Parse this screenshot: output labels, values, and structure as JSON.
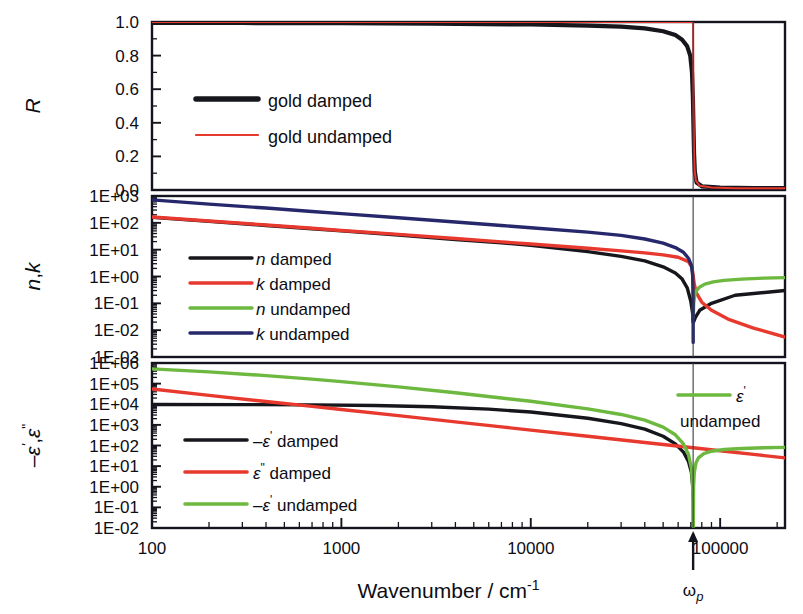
{
  "figure": {
    "xlabel": "Wavenumber / cm",
    "xlabel_exponent": "-1",
    "plasma_marker": "ω",
    "plasma_marker_sub": "p",
    "plasma_value": 72000
  },
  "colors": {
    "black": "#16161d",
    "red": "#e8392f",
    "green": "#6db83f",
    "navy": "#27286b",
    "frame": "#14141e",
    "vline": "#3a3a44"
  },
  "xaxis": {
    "min": 100,
    "max": 220000,
    "scale": "log",
    "ticks": [
      {
        "value": 100,
        "label": "100"
      },
      {
        "value": 1000,
        "label": "1000"
      },
      {
        "value": 10000,
        "label": "10000"
      },
      {
        "value": 100000,
        "label": "100000"
      }
    ]
  },
  "chart_data": [
    {
      "type": "line",
      "panel": "top",
      "ylabel": "R",
      "xlabel": "Wavenumber / cm-1",
      "yscale": "linear",
      "ylim": [
        0.0,
        1.0
      ],
      "yticks": [
        "0.0",
        "0.2",
        "0.4",
        "0.6",
        "0.8",
        "1.0"
      ],
      "grid": false,
      "legend_position": "center-left",
      "series": [
        {
          "name": "gold damped",
          "color": "#16161d",
          "width": 4.2,
          "points": [
            [
              100,
              0.995
            ],
            [
              300,
              0.994
            ],
            [
              1000,
              0.993
            ],
            [
              3000,
              0.99
            ],
            [
              10000,
              0.985
            ],
            [
              20000,
              0.979
            ],
            [
              30000,
              0.972
            ],
            [
              40000,
              0.962
            ],
            [
              50000,
              0.945
            ],
            [
              58000,
              0.922
            ],
            [
              63000,
              0.895
            ],
            [
              67000,
              0.855
            ],
            [
              69500,
              0.8
            ],
            [
              71000,
              0.7
            ],
            [
              71800,
              0.55
            ],
            [
              72300,
              0.38
            ],
            [
              72800,
              0.22
            ],
            [
              73500,
              0.11
            ],
            [
              75000,
              0.045
            ],
            [
              80000,
              0.022
            ],
            [
              100000,
              0.014
            ],
            [
              150000,
              0.012
            ],
            [
              220000,
              0.012
            ]
          ]
        },
        {
          "name": "gold undamped",
          "color": "#e8392f",
          "width": 2.0,
          "points": [
            [
              100,
              1.0
            ],
            [
              1000,
              1.0
            ],
            [
              10000,
              1.0
            ],
            [
              40000,
              1.0
            ],
            [
              60000,
              1.0
            ],
            [
              69000,
              1.0
            ],
            [
              71000,
              1.0
            ],
            [
              71900,
              1.0
            ],
            [
              72000,
              0.99
            ],
            [
              72100,
              0.8
            ],
            [
              72300,
              0.5
            ],
            [
              72700,
              0.25
            ],
            [
              73300,
              0.12
            ],
            [
              74500,
              0.055
            ],
            [
              78000,
              0.025
            ],
            [
              90000,
              0.015
            ],
            [
              120000,
              0.011
            ],
            [
              220000,
              0.01
            ]
          ]
        }
      ]
    },
    {
      "type": "line",
      "panel": "middle",
      "ylabel": "n,k",
      "yscale": "log",
      "ylim": [
        0.001,
        1000
      ],
      "yticks": [
        "1E-03",
        "1E-02",
        "1E-01",
        "1E+00",
        "1E+01",
        "1E+02",
        "1E+03"
      ],
      "grid": false,
      "legend_position": "left",
      "series": [
        {
          "name": "n damped",
          "color": "#16161d",
          "width": 3.4,
          "points": [
            [
              100,
              160
            ],
            [
              200,
              113
            ],
            [
              400,
              80
            ],
            [
              700,
              60
            ],
            [
              1000,
              50
            ],
            [
              2000,
              35
            ],
            [
              4000,
              24
            ],
            [
              7000,
              18
            ],
            [
              10000,
              14.5
            ],
            [
              20000,
              8.5
            ],
            [
              30000,
              5.6
            ],
            [
              40000,
              3.8
            ],
            [
              50000,
              2.3
            ],
            [
              58000,
              1.35
            ],
            [
              63000,
              0.8
            ],
            [
              67000,
              0.38
            ],
            [
              70000,
              0.12
            ],
            [
              71500,
              0.045
            ],
            [
              72000,
              0.02
            ],
            [
              72600,
              0.021
            ],
            [
              74000,
              0.03
            ],
            [
              78000,
              0.055
            ],
            [
              90000,
              0.1
            ],
            [
              120000,
              0.2
            ],
            [
              220000,
              0.3
            ]
          ]
        },
        {
          "name": "k damped",
          "color": "#e8392f",
          "width": 3.4,
          "points": [
            [
              100,
              165
            ],
            [
              200,
              117
            ],
            [
              400,
              83
            ],
            [
              700,
              63
            ],
            [
              1000,
              52
            ],
            [
              2000,
              37
            ],
            [
              4000,
              26
            ],
            [
              7000,
              19.5
            ],
            [
              10000,
              16.2
            ],
            [
              20000,
              11.3
            ],
            [
              30000,
              9.0
            ],
            [
              40000,
              7.6
            ],
            [
              50000,
              6.4
            ],
            [
              60000,
              5.2
            ],
            [
              68000,
              3.6
            ],
            [
              71000,
              2.2
            ],
            [
              72000,
              1.1
            ],
            [
              73000,
              0.52
            ],
            [
              75000,
              0.24
            ],
            [
              80000,
              0.11
            ],
            [
              90000,
              0.055
            ],
            [
              110000,
              0.026
            ],
            [
              150000,
              0.012
            ],
            [
              220000,
              0.0055
            ]
          ]
        },
        {
          "name": "n undamped",
          "color": "#6db83f",
          "width": 3.4,
          "points": [
            [
              72100,
              0.03
            ],
            [
              72500,
              0.1
            ],
            [
              73500,
              0.21
            ],
            [
              75000,
              0.3
            ],
            [
              78000,
              0.41
            ],
            [
              83000,
              0.52
            ],
            [
              92000,
              0.63
            ],
            [
              105000,
              0.72
            ],
            [
              130000,
              0.8
            ],
            [
              170000,
              0.87
            ],
            [
              220000,
              0.91
            ]
          ]
        },
        {
          "name": "k undamped",
          "color": "#27286b",
          "width": 3.4,
          "points": [
            [
              100,
              720
            ],
            [
              200,
              500
            ],
            [
              400,
              355
            ],
            [
              700,
              265
            ],
            [
              1000,
              220
            ],
            [
              2000,
              155
            ],
            [
              4000,
              108
            ],
            [
              7000,
              80
            ],
            [
              10000,
              66
            ],
            [
              20000,
              45
            ],
            [
              30000,
              34
            ],
            [
              40000,
              25
            ],
            [
              50000,
              17.5
            ],
            [
              58000,
              12.0
            ],
            [
              64000,
              8.0
            ],
            [
              68000,
              4.8
            ],
            [
              70500,
              2.6
            ],
            [
              71600,
              1.1
            ],
            [
              72000,
              0.1
            ],
            [
              72050,
              0.0035
            ]
          ]
        }
      ]
    },
    {
      "type": "line",
      "panel": "bottom",
      "ylabel": "-ε',ε\"",
      "yscale": "log",
      "ylim": [
        0.01,
        1000000
      ],
      "yticks": [
        "1E-02",
        "1E-01",
        "1E+00",
        "1E+01",
        "1E+02",
        "1E+03",
        "1E+04",
        "1E+05",
        "1E+06"
      ],
      "grid": false,
      "legend_position": "left",
      "series": [
        {
          "name": "-ε' damped",
          "color": "#16161d",
          "width": 3.4,
          "points": [
            [
              100,
              9800
            ],
            [
              300,
              9600
            ],
            [
              700,
              9300
            ],
            [
              1500,
              8700
            ],
            [
              3000,
              7600
            ],
            [
              6000,
              5800
            ],
            [
              10000,
              4200
            ],
            [
              20000,
              2100
            ],
            [
              30000,
              1150
            ],
            [
              40000,
              620
            ],
            [
              50000,
              280
            ],
            [
              58000,
              120
            ],
            [
              64000,
              48
            ],
            [
              68000,
              17
            ],
            [
              70500,
              5.0
            ],
            [
              71600,
              1.2
            ],
            [
              72000,
              0.3
            ]
          ]
        },
        {
          "name": "ε\" damped",
          "color": "#e8392f",
          "width": 3.4,
          "points": [
            [
              100,
              55000
            ],
            [
              200,
              27000
            ],
            [
              400,
              13500
            ],
            [
              700,
              7900
            ],
            [
              1000,
              5600
            ],
            [
              2000,
              2800
            ],
            [
              4000,
              1400
            ],
            [
              7000,
              800
            ],
            [
              10000,
              560
            ],
            [
              20000,
              280
            ],
            [
              40000,
              140
            ],
            [
              70000,
              80
            ],
            [
              100000,
              56
            ],
            [
              150000,
              37
            ],
            [
              220000,
              25
            ]
          ]
        },
        {
          "name": "-ε' undamped",
          "color": "#6db83f",
          "width": 3.4,
          "points": [
            [
              100,
              520000
            ],
            [
              200,
              370000
            ],
            [
              400,
              245000
            ],
            [
              700,
              165000
            ],
            [
              1000,
              125000
            ],
            [
              2000,
              70000
            ],
            [
              4000,
              36000
            ],
            [
              7000,
              20000
            ],
            [
              10000,
              14000
            ],
            [
              20000,
              6000
            ],
            [
              30000,
              3200
            ],
            [
              40000,
              1700
            ],
            [
              50000,
              780
            ],
            [
              58000,
              330
            ],
            [
              64000,
              120
            ],
            [
              68000,
              38
            ],
            [
              70500,
              8.0
            ],
            [
              71600,
              1.0
            ],
            [
              72000,
              0.012
            ]
          ]
        },
        {
          "name": "ε' undamped",
          "color": "#6db83f",
          "width": 3.4,
          "points": [
            [
              72050,
              0.012
            ],
            [
              72400,
              1.0
            ],
            [
              73000,
              5.0
            ],
            [
              74500,
              14
            ],
            [
              77000,
              26
            ],
            [
              82000,
              40
            ],
            [
              90000,
              53
            ],
            [
              105000,
              64
            ],
            [
              130000,
              72
            ],
            [
              170000,
              78
            ],
            [
              220000,
              81
            ]
          ]
        }
      ]
    }
  ],
  "legends": {
    "top": [
      {
        "label": "gold damped",
        "color": "#16161d",
        "width": 5.5
      },
      {
        "label": "gold undamped",
        "color": "#e8392f",
        "width": 2.2
      }
    ],
    "middle": [
      {
        "symbol": "n",
        "rest": " damped",
        "color": "#16161d"
      },
      {
        "symbol": "k",
        "rest": " damped",
        "color": "#e8392f"
      },
      {
        "symbol": "n",
        "rest": " undamped",
        "color": "#6db83f"
      },
      {
        "symbol": "k",
        "rest": " undamped",
        "color": "#27286b"
      }
    ],
    "bottom": [
      {
        "prefix": "–",
        "symbol": "ε",
        "sup": "'",
        "rest": " damped",
        "color": "#16161d"
      },
      {
        "prefix": "",
        "symbol": "ε",
        "sup": "\"",
        "rest": " damped",
        "color": "#e8392f"
      },
      {
        "prefix": "–",
        "symbol": "ε",
        "sup": "'",
        "rest": " undamped",
        "color": "#6db83f"
      }
    ],
    "bottom_inset": {
      "symbol": "ε",
      "sup": "'",
      "line2": "undamped",
      "color": "#6db83f"
    }
  }
}
